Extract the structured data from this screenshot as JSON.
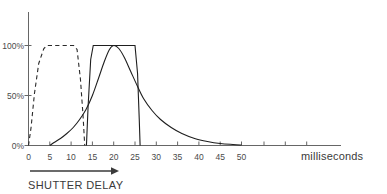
{
  "chart_data": {
    "type": "line",
    "title": "",
    "xlabel": "SHUTTER DELAY",
    "xunit": "milliseconds",
    "ylabel": "",
    "xlim": [
      0,
      50
    ],
    "ylim": [
      0,
      100
    ],
    "grid": false,
    "legend": "none",
    "xticks": [
      0,
      5,
      10,
      15,
      20,
      25,
      30,
      35,
      40,
      45,
      50
    ],
    "xtick_labels": [
      "0",
      "5",
      "10",
      "15",
      "20",
      "25",
      "30",
      "35",
      "40",
      "45",
      "50"
    ],
    "yticks": [
      0,
      50,
      100
    ],
    "ytick_labels": [
      "0%",
      "50%",
      "100%"
    ],
    "series": [
      {
        "name": "first-shutter-pulse",
        "style": "dashed",
        "points": [
          [
            0,
            0
          ],
          [
            0.6,
            18
          ],
          [
            1.4,
            52
          ],
          [
            2.4,
            82
          ],
          [
            3.6,
            97
          ],
          [
            4.4,
            100
          ],
          [
            10.6,
            100
          ],
          [
            11.4,
            96
          ],
          [
            12.2,
            66
          ],
          [
            12.8,
            30
          ],
          [
            13.2,
            0
          ]
        ]
      },
      {
        "name": "second-shutter-pulse",
        "style": "solid",
        "points": [
          [
            13.6,
            0
          ],
          [
            14.0,
            40
          ],
          [
            14.6,
            86
          ],
          [
            15.2,
            100
          ],
          [
            25.0,
            100
          ],
          [
            25.6,
            72
          ],
          [
            26.0,
            26
          ],
          [
            26.2,
            0
          ]
        ]
      },
      {
        "name": "response-envelope",
        "style": "solid",
        "points": [
          [
            5.0,
            0
          ],
          [
            6.0,
            3
          ],
          [
            7.5,
            7
          ],
          [
            9.0,
            12
          ],
          [
            10.5,
            18
          ],
          [
            12.0,
            26
          ],
          [
            13.5,
            36
          ],
          [
            15.0,
            50
          ],
          [
            16.5,
            68
          ],
          [
            17.8,
            84
          ],
          [
            19.0,
            96
          ],
          [
            20.0,
            100
          ],
          [
            21.2,
            97
          ],
          [
            22.5,
            88
          ],
          [
            24.0,
            74
          ],
          [
            25.5,
            60
          ],
          [
            27.0,
            47
          ],
          [
            29.0,
            35
          ],
          [
            31.0,
            26
          ],
          [
            33.5,
            18
          ],
          [
            36.0,
            12
          ],
          [
            39.0,
            7
          ],
          [
            42.0,
            4
          ],
          [
            45.0,
            2
          ],
          [
            48.0,
            1
          ],
          [
            50.0,
            0.5
          ]
        ]
      }
    ],
    "annotations": [
      {
        "name": "direction-arrow",
        "text": "",
        "orientation": "right"
      }
    ],
    "colors": {
      "axis": "#555555",
      "curve": "#1e1e1e",
      "dashed_curve": "#2a2a2a",
      "text": "#3a3a3a",
      "background": "#ffffff"
    }
  }
}
